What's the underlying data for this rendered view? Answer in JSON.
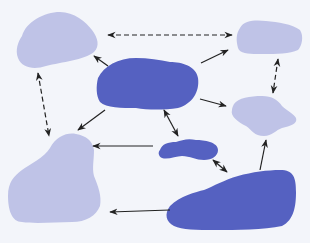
{
  "diagram": {
    "type": "blob-network",
    "colors": {
      "background": "#f3f5fa",
      "light_node": "#bfc3e7",
      "dark_node": "#5561c1",
      "arrow": "#222222"
    },
    "nodes": [
      {
        "id": "top-left",
        "shade": "light"
      },
      {
        "id": "top-right",
        "shade": "light"
      },
      {
        "id": "center",
        "shade": "dark"
      },
      {
        "id": "mid-right",
        "shade": "light"
      },
      {
        "id": "small-center",
        "shade": "dark"
      },
      {
        "id": "bottom-left",
        "shade": "light"
      },
      {
        "id": "bottom-right",
        "shade": "dark"
      }
    ],
    "edges": [
      {
        "from": "top-left",
        "to": "top-right",
        "style": "dashed",
        "direction": "both"
      },
      {
        "from": "top-left",
        "to": "bottom-left",
        "style": "dashed",
        "direction": "both"
      },
      {
        "from": "top-right",
        "to": "mid-right",
        "style": "dashed",
        "direction": "both"
      },
      {
        "from": "center",
        "to": "top-left",
        "style": "solid",
        "direction": "forward"
      },
      {
        "from": "center",
        "to": "top-right",
        "style": "solid",
        "direction": "forward"
      },
      {
        "from": "center",
        "to": "mid-right",
        "style": "solid",
        "direction": "forward"
      },
      {
        "from": "center",
        "to": "bottom-left",
        "style": "solid",
        "direction": "forward"
      },
      {
        "from": "center",
        "to": "small-center",
        "style": "solid",
        "direction": "both"
      },
      {
        "from": "small-center",
        "to": "bottom-left",
        "style": "solid",
        "direction": "forward"
      },
      {
        "from": "small-center",
        "to": "bottom-right",
        "style": "solid",
        "direction": "both"
      },
      {
        "from": "bottom-right",
        "to": "mid-right",
        "style": "solid",
        "direction": "forward"
      },
      {
        "from": "bottom-right",
        "to": "bottom-left",
        "style": "solid",
        "direction": "forward"
      }
    ]
  }
}
